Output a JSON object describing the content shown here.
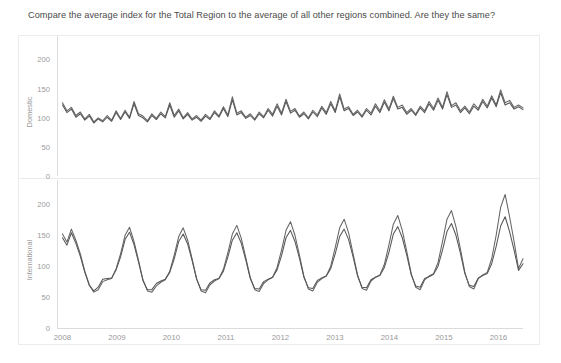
{
  "header": {
    "title": "Compare the average index for the Total Region to the average of all other regions combined. Are they the same?"
  },
  "colors": {
    "background": "#ffffff",
    "panel_border": "#ececec",
    "axis": "#dcdcdc",
    "tick_text": "#9a9a9a",
    "title_text": "#4a4a4a",
    "series_total": "#646464",
    "series_other": "#565656"
  },
  "chart_data": [
    {
      "type": "line",
      "title": "",
      "ylabel": "Domestic",
      "xlabel": "",
      "ylim": [
        0,
        220
      ],
      "yticks": [
        0,
        50,
        100,
        150,
        200
      ],
      "ytick_labels": [
        "0",
        "50",
        "100",
        "150",
        "200"
      ],
      "xlim": [
        2007.9,
        2016.45
      ],
      "xticks": [
        2008,
        2009,
        2010,
        2011,
        2012,
        2013,
        2014,
        2015,
        2016
      ],
      "xtick_labels": [
        "2008",
        "2009",
        "2010",
        "2011",
        "2012",
        "2013",
        "2014",
        "2015",
        "2016"
      ],
      "grid": false,
      "legend": "none",
      "series": [
        {
          "name": "Total Region",
          "values": [
            126,
            112,
            118,
            104,
            110,
            98,
            106,
            93,
            100,
            95,
            104,
            96,
            112,
            99,
            113,
            101,
            128,
            107,
            103,
            95,
            107,
            99,
            110,
            102,
            126,
            104,
            115,
            100,
            109,
            98,
            104,
            96,
            106,
            99,
            112,
            103,
            119,
            105,
            136,
            108,
            112,
            101,
            107,
            98,
            110,
            102,
            116,
            106,
            124,
            108,
            132,
            111,
            116,
            103,
            110,
            100,
            113,
            105,
            120,
            109,
            128,
            112,
            141,
            115,
            119,
            106,
            113,
            103,
            116,
            108,
            124,
            112,
            131,
            115,
            137,
            118,
            122,
            109,
            116,
            106,
            120,
            112,
            128,
            116,
            134,
            118,
            145,
            121,
            126,
            112,
            120,
            110,
            124,
            116,
            132,
            120,
            138,
            122,
            148,
            126,
            130,
            118,
            122,
            117
          ]
        },
        {
          "name": "All Other Regions Combined",
          "values": [
            122,
            109,
            115,
            101,
            107,
            96,
            103,
            91,
            98,
            93,
            101,
            94,
            109,
            97,
            110,
            99,
            124,
            104,
            100,
            93,
            104,
            97,
            107,
            100,
            122,
            101,
            112,
            98,
            106,
            96,
            101,
            94,
            103,
            97,
            109,
            101,
            116,
            102,
            131,
            105,
            109,
            99,
            104,
            96,
            107,
            100,
            113,
            103,
            120,
            105,
            128,
            108,
            113,
            101,
            107,
            98,
            110,
            102,
            117,
            106,
            124,
            109,
            136,
            112,
            116,
            104,
            110,
            101,
            113,
            105,
            120,
            109,
            127,
            112,
            133,
            115,
            118,
            106,
            113,
            104,
            117,
            109,
            124,
            113,
            130,
            115,
            140,
            118,
            122,
            109,
            117,
            107,
            120,
            113,
            128,
            117,
            134,
            119,
            143,
            122,
            126,
            115,
            119,
            114
          ]
        }
      ]
    },
    {
      "type": "line",
      "title": "",
      "ylabel": "International",
      "xlabel": "",
      "ylim": [
        0,
        220
      ],
      "yticks": [
        0,
        50,
        100,
        150,
        200
      ],
      "ytick_labels": [
        "0",
        "50",
        "100",
        "150",
        "200"
      ],
      "xlim": [
        2007.9,
        2016.45
      ],
      "xticks": [
        2008,
        2009,
        2010,
        2011,
        2012,
        2013,
        2014,
        2015,
        2016
      ],
      "xtick_labels": [
        "2008",
        "2009",
        "2010",
        "2011",
        "2012",
        "2013",
        "2014",
        "2015",
        "2016"
      ],
      "grid": false,
      "legend": "none",
      "series": [
        {
          "name": "Total Region",
          "values": [
            152,
            139,
            160,
            142,
            120,
            92,
            70,
            58,
            62,
            75,
            78,
            80,
            96,
            120,
            150,
            163,
            140,
            110,
            78,
            60,
            58,
            68,
            74,
            78,
            92,
            118,
            148,
            162,
            142,
            112,
            80,
            60,
            57,
            70,
            76,
            80,
            95,
            122,
            152,
            166,
            145,
            114,
            82,
            62,
            59,
            72,
            78,
            82,
            98,
            126,
            158,
            172,
            150,
            118,
            84,
            63,
            60,
            74,
            80,
            84,
            100,
            130,
            162,
            176,
            154,
            120,
            86,
            64,
            61,
            76,
            82,
            86,
            103,
            134,
            168,
            182,
            158,
            124,
            88,
            66,
            62,
            78,
            84,
            88,
            106,
            140,
            176,
            190,
            164,
            128,
            90,
            67,
            63,
            80,
            86,
            90,
            112,
            150,
            195,
            216,
            180,
            140,
            96,
            112
          ]
        },
        {
          "name": "All Other Regions Combined",
          "values": [
            146,
            134,
            154,
            137,
            116,
            90,
            69,
            60,
            66,
            79,
            80,
            81,
            94,
            115,
            143,
            155,
            135,
            107,
            77,
            62,
            62,
            72,
            76,
            79,
            90,
            112,
            140,
            152,
            136,
            109,
            79,
            62,
            61,
            73,
            78,
            80,
            92,
            115,
            142,
            154,
            137,
            110,
            80,
            64,
            63,
            75,
            79,
            82,
            94,
            117,
            146,
            158,
            140,
            113,
            82,
            65,
            64,
            77,
            81,
            84,
            96,
            120,
            148,
            160,
            143,
            115,
            84,
            66,
            65,
            78,
            82,
            85,
            98,
            122,
            152,
            164,
            146,
            118,
            86,
            68,
            66,
            80,
            83,
            87,
            100,
            126,
            156,
            169,
            150,
            121,
            88,
            69,
            67,
            81,
            85,
            88,
            104,
            132,
            165,
            180,
            156,
            126,
            93,
            104
          ]
        }
      ]
    }
  ]
}
